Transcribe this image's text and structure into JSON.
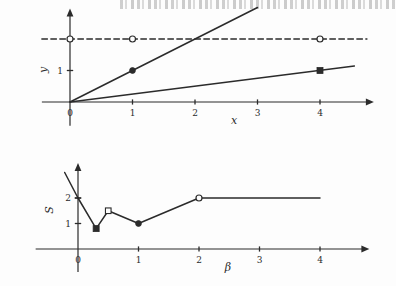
{
  "page": {
    "background_color": "#fdfdfd",
    "ink_color": "#2b2b2b",
    "scan_artifact_top": true
  },
  "chart_data": [
    {
      "id": "top",
      "type": "line",
      "title": "",
      "xlabel": "x",
      "ylabel": "y",
      "xlim": [
        -0.45,
        4.75
      ],
      "ylim": [
        -0.75,
        2.75
      ],
      "grid": false,
      "legend": false,
      "xticks": [
        0,
        1,
        2,
        3,
        4
      ],
      "xtick_labels": [
        "0",
        "1",
        "2",
        "3",
        "4"
      ],
      "yticks": [
        1
      ],
      "ytick_labels": [
        "1"
      ],
      "axis_arrows": [
        "x-positive",
        "y-positive"
      ],
      "series": [
        {
          "name": "steep-line",
          "style": "solid",
          "x": [
            0,
            3
          ],
          "y": [
            0,
            3
          ],
          "slope": 1,
          "markers": [
            {
              "x": 1,
              "y": 1,
              "shape": "filled-circle"
            }
          ]
        },
        {
          "name": "shallow-line",
          "style": "solid",
          "x": [
            0,
            4.55
          ],
          "y": [
            0,
            1.14
          ],
          "slope": 0.25,
          "markers": [
            {
              "x": 4,
              "y": 1,
              "shape": "filled-square"
            }
          ]
        },
        {
          "name": "asymptote",
          "style": "dashed",
          "x": [
            -0.45,
            4.75
          ],
          "y": [
            2,
            2
          ],
          "level": 2,
          "markers": [
            {
              "x": 0,
              "y": 2,
              "shape": "open-circle"
            },
            {
              "x": 1,
              "y": 2,
              "shape": "open-circle"
            },
            {
              "x": 4,
              "y": 2,
              "shape": "open-circle"
            }
          ]
        }
      ]
    },
    {
      "id": "bottom",
      "type": "line",
      "title": "",
      "xlabel": "β",
      "ylabel": "S",
      "xlim": [
        -0.7,
        4.7
      ],
      "ylim": [
        -0.9,
        3.1
      ],
      "grid": false,
      "legend": false,
      "xticks": [
        0,
        1,
        2,
        3,
        4
      ],
      "xtick_labels": [
        "0",
        "1",
        "2",
        "3",
        "4"
      ],
      "yticks": [
        1,
        2
      ],
      "ytick_labels": [
        "1",
        "2"
      ],
      "axis_arrows": [
        "x-positive",
        "y-positive"
      ],
      "series": [
        {
          "name": "S-of-beta",
          "style": "solid",
          "x": [
            -0.22,
            0.0,
            0.3,
            0.5,
            1.0,
            2.0,
            4.0
          ],
          "y": [
            3.0,
            2.0,
            0.8,
            1.5,
            1.0,
            2.0,
            2.0
          ],
          "markers": [
            {
              "x": 0.0,
              "y": 2.0,
              "shape": "tick-crossing"
            },
            {
              "x": 0.3,
              "y": 0.8,
              "shape": "filled-square"
            },
            {
              "x": 0.5,
              "y": 1.5,
              "shape": "open-square"
            },
            {
              "x": 1.0,
              "y": 1.0,
              "shape": "filled-circle"
            },
            {
              "x": 2.0,
              "y": 2.0,
              "shape": "open-circle"
            }
          ]
        }
      ]
    }
  ]
}
